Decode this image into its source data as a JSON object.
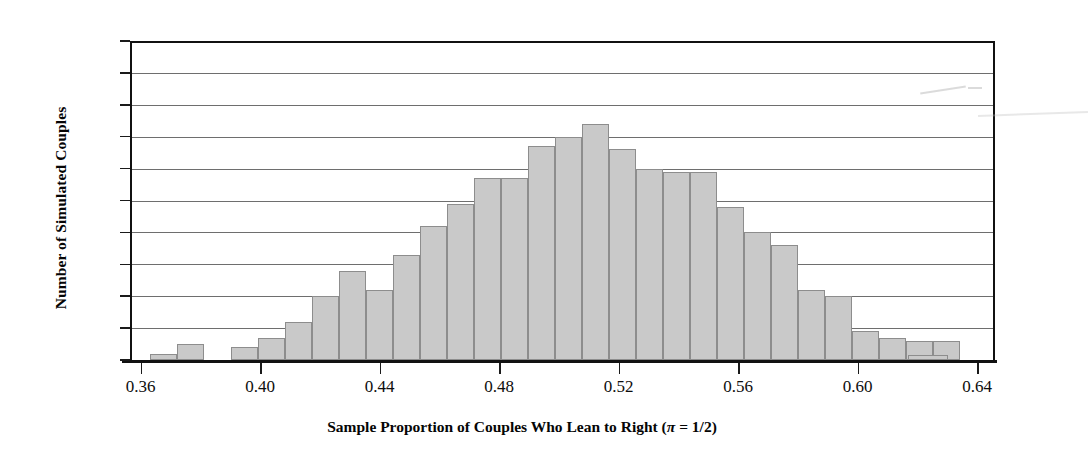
{
  "axes": {
    "y_title": "Number of Simulated Couples",
    "x_title_prefix": "Sample Proportion of Couples Who Lean to Right (",
    "x_title_pi": "π",
    "x_title_suffix": " = 1/2)",
    "y_ticks": [
      "0",
      "10",
      "20",
      "30",
      "40",
      "50",
      "60",
      "70",
      "80",
      "90",
      "100"
    ],
    "x_ticks": [
      "0.36",
      "0.40",
      "0.44",
      "0.48",
      "0.52",
      "0.56",
      "0.60",
      "0.64"
    ]
  },
  "style": {
    "bar_fill": "#c9c9c9",
    "bar_stroke": "#8d8d8d",
    "grid_color": "#6e6e6e",
    "axis_color": "#111111"
  },
  "chart_data": {
    "type": "bar",
    "title": "",
    "xlabel": "Sample Proportion of Couples Who Lean to Right (π = 1/2)",
    "ylabel": "Number of Simulated Couples",
    "xlim": [
      0.3545,
      0.6445
    ],
    "ylim": [
      0,
      100
    ],
    "grid": true,
    "legend": "none",
    "bin_width": 0.009,
    "bar_count": 32,
    "categories": [
      "0.363",
      "0.372",
      "0.381",
      "0.390",
      "0.399",
      "0.408",
      "0.417",
      "0.426",
      "0.435",
      "0.444",
      "0.453",
      "0.462",
      "0.471",
      "0.480",
      "0.489",
      "0.498",
      "0.507",
      "0.516",
      "0.525",
      "0.534",
      "0.543",
      "0.552",
      "0.561",
      "0.570",
      "0.579",
      "0.588",
      "0.597",
      "0.606",
      "0.615",
      "0.624",
      "0.633",
      "0.642"
    ],
    "values": [
      2,
      5,
      0,
      4,
      7,
      12,
      20,
      28,
      22,
      33,
      42,
      49,
      57,
      57,
      67,
      70,
      74,
      66,
      60,
      59,
      59,
      48,
      40,
      36,
      22,
      20,
      9,
      7,
      6,
      6,
      4,
      1
    ],
    "bar_left_px": [
      150,
      177,
      204,
      231,
      258,
      285,
      312,
      339,
      366,
      393,
      420,
      447,
      474,
      501,
      528,
      555,
      582,
      609,
      636,
      663,
      690,
      717,
      744,
      771,
      798,
      825,
      852,
      879,
      906,
      933,
      960,
      960
    ],
    "tail_bar": {
      "value": 1,
      "left_px": 908,
      "width_px": 40
    }
  }
}
